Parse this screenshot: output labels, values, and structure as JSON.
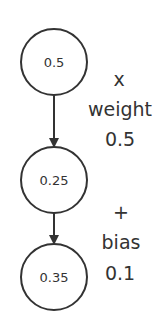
{
  "diagram": {
    "nodes": [
      {
        "id": "input",
        "value": "0.5"
      },
      {
        "id": "weighted",
        "value": "0.25"
      },
      {
        "id": "output",
        "value": "0.35"
      }
    ],
    "operations": [
      {
        "symbol": "x",
        "name": "weight",
        "value": "0.5"
      },
      {
        "symbol": "+",
        "name": "bias",
        "value": "0.1"
      }
    ],
    "colors": {
      "stroke": "#333333",
      "background": "#ffffff"
    }
  }
}
